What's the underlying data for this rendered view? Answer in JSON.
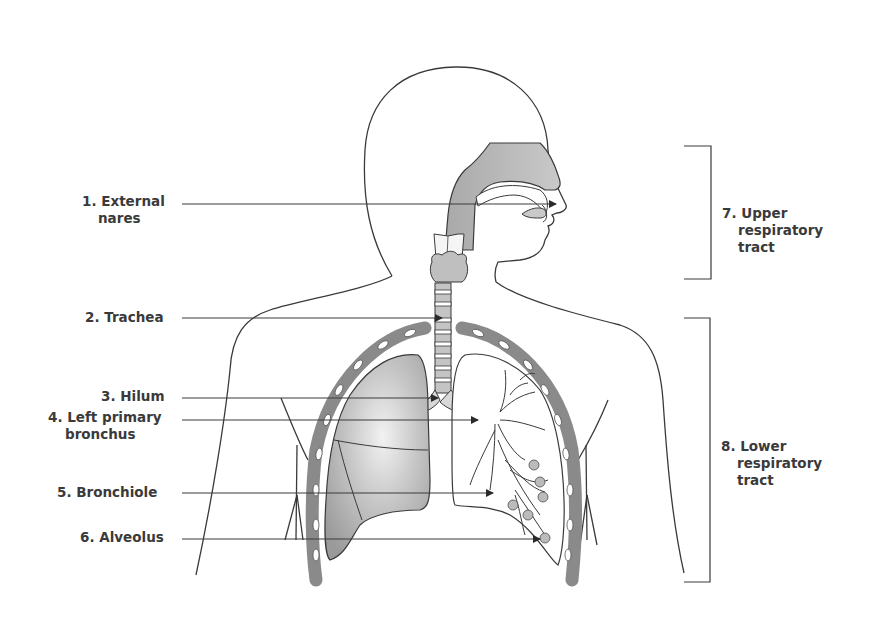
{
  "diagram": {
    "colors": {
      "outline": "#3a3a3a",
      "airway_fill": "#b5b5b5",
      "lung_fill": "#a8a8a8",
      "rib": "#8a8a8a",
      "label_text": "#3a3a3a"
    },
    "labels": [
      {
        "id": 1,
        "line1": "1. External",
        "line2": "nares",
        "target": "nostril"
      },
      {
        "id": 2,
        "line1": "2. Trachea",
        "line2": "",
        "target": "trachea"
      },
      {
        "id": 3,
        "line1": "3. Hilum",
        "line2": "",
        "target": "hilum"
      },
      {
        "id": 4,
        "line1": "4. Left primary",
        "line2": "bronchus",
        "target": "left-primary-bronchus"
      },
      {
        "id": 5,
        "line1": "5. Bronchiole",
        "line2": "",
        "target": "bronchiole"
      },
      {
        "id": 6,
        "line1": "6. Alveolus",
        "line2": "",
        "target": "alveolus"
      }
    ],
    "brackets": [
      {
        "id": 7,
        "line1": "7. Upper",
        "line2": "respiratory",
        "line3": "tract"
      },
      {
        "id": 8,
        "line1": "8. Lower",
        "line2": "respiratory",
        "line3": "tract"
      }
    ]
  }
}
